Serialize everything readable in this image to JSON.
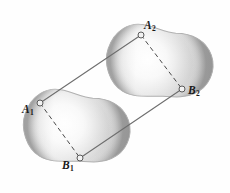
{
  "figure": {
    "background_color": "#fefefe",
    "width": 230,
    "height": 193,
    "bodies": [
      {
        "id": "body-1",
        "name": "lower-left-body",
        "description": "peanut-shaped shaded region, lower left, tilted",
        "fill_light": "#fcfcfc",
        "fill_mid": "#c9c9c9",
        "fill_dark": "#9e9e9e",
        "outline_color": "#b3b3b3",
        "center": {
          "x": 74,
          "y": 128
        },
        "rotation_deg": -42
      },
      {
        "id": "body-2",
        "name": "upper-right-body",
        "description": "peanut-shaped shaded region, upper right, tilted",
        "fill_light": "#fcfcfc",
        "fill_mid": "#c9c9c9",
        "fill_dark": "#9e9e9e",
        "outline_color": "#b3b3b3",
        "center": {
          "x": 157,
          "y": 63
        },
        "rotation_deg": -42
      }
    ],
    "points": [
      {
        "id": "A1",
        "letter": "A",
        "subscript": "1",
        "x": 40,
        "y": 103,
        "marker": "open-circle"
      },
      {
        "id": "B1",
        "letter": "B",
        "subscript": "1",
        "x": 80,
        "y": 158,
        "marker": "open-circle"
      },
      {
        "id": "A2",
        "letter": "A",
        "subscript": "2",
        "x": 141,
        "y": 35,
        "marker": "open-circle"
      },
      {
        "id": "B2",
        "letter": "B",
        "subscript": "2",
        "x": 182,
        "y": 89,
        "marker": "open-circle"
      }
    ],
    "connectors": [
      {
        "id": "A1-A2",
        "from": "A1",
        "to": "A2",
        "style": "solid",
        "color": "#6e6e6e",
        "width": 1.1
      },
      {
        "id": "B1-B2",
        "from": "B1",
        "to": "B2",
        "style": "solid",
        "color": "#6e6e6e",
        "width": 1.1
      },
      {
        "id": "A1-B1",
        "from": "A1",
        "to": "B1",
        "style": "dashed",
        "color": "#4a4a4a",
        "width": 1.0
      },
      {
        "id": "A2-B2",
        "from": "A2",
        "to": "B2",
        "style": "dashed",
        "color": "#4a4a4a",
        "width": 1.0
      }
    ],
    "marker_style": {
      "radius": 3.0,
      "fill": "#f2f2f2",
      "stroke": "#5a5a5a",
      "stroke_width": 1.0
    },
    "labels": {
      "A1": {
        "letter": "A",
        "subscript": "1"
      },
      "B1": {
        "letter": "B",
        "subscript": "1"
      },
      "A2": {
        "letter": "A",
        "subscript": "2"
      },
      "B2": {
        "letter": "B",
        "subscript": "2"
      }
    }
  }
}
